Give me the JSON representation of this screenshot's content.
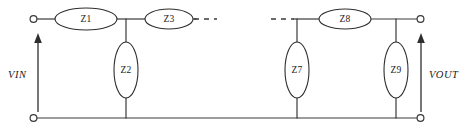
{
  "diagram": {
    "background_color": "#ffffff",
    "line_color": "#3a3a3a",
    "text_color": "#1c1c1c"
  },
  "ports": {
    "input": {
      "label": "VIN",
      "arrow": "up-arrow-icon",
      "terminal_top": "input-terminal-top",
      "terminal_bottom": "input-terminal-bottom"
    },
    "output": {
      "label": "VOUT",
      "arrow": "up-arrow-icon",
      "terminal_top": "output-terminal-top",
      "terminal_bottom": "output-terminal-bottom"
    }
  },
  "series_components": [
    {
      "id": "Z1",
      "label": "Z1",
      "cx": 86,
      "cy": 19,
      "rx": 31,
      "ry": 11
    },
    {
      "id": "Z3",
      "label": "Z3",
      "cx": 169,
      "cy": 19,
      "rx": 24,
      "ry": 10
    },
    {
      "id": "Z8",
      "label": "Z8",
      "cx": 345,
      "cy": 19,
      "rx": 26,
      "ry": 10
    }
  ],
  "shunt_components": [
    {
      "id": "Z2",
      "label": "Z2",
      "cx": 126,
      "cy": 70,
      "rx": 12,
      "ry": 28
    },
    {
      "id": "Z7",
      "label": "Z7",
      "cx": 297,
      "cy": 70,
      "rx": 12,
      "ry": 28
    },
    {
      "id": "Z9",
      "label": "Z9",
      "cx": 396,
      "cy": 70,
      "rx": 12,
      "ry": 28
    }
  ],
  "continuation": [
    {
      "id": "left-ellipsis",
      "label": "---",
      "x1": 194,
      "x2": 216,
      "y": 19
    },
    {
      "id": "right-ellipsis",
      "label": "---",
      "x1": 272,
      "x2": 294,
      "y": 19
    }
  ],
  "rails": {
    "top_y": 19,
    "bottom_y": 118
  }
}
